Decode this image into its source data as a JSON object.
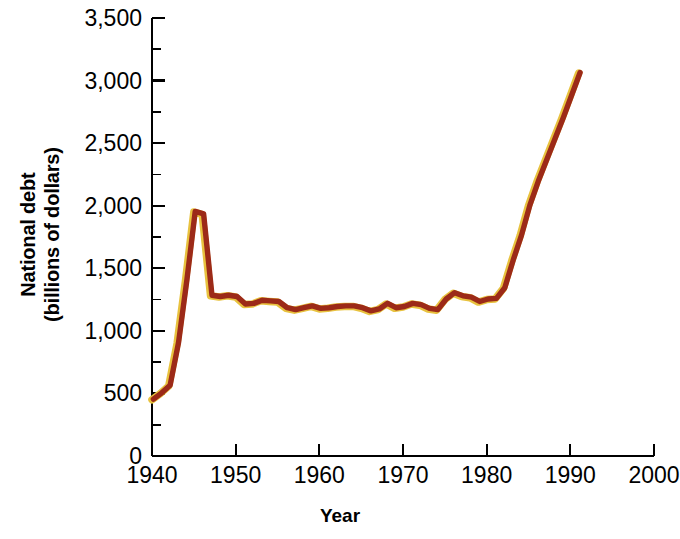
{
  "chart_data": {
    "type": "line",
    "title": "",
    "xlabel": "Year",
    "ylabel": "National debt\n(billions of dollars)",
    "ylabel_line1": "National debt",
    "ylabel_line2": "(billions of dollars)",
    "xlim": [
      1940,
      2000
    ],
    "ylim": [
      0,
      3500
    ],
    "xticks": [
      1940,
      1950,
      1960,
      1970,
      1980,
      1990,
      2000
    ],
    "xtick_labels": [
      "1940",
      "1950",
      "1960",
      "1970",
      "1980",
      "1990",
      "2000"
    ],
    "yticks": [
      0,
      500,
      1000,
      1500,
      2000,
      2500,
      3000,
      3500
    ],
    "ytick_labels": [
      "0",
      "500",
      "1,000",
      "1,500",
      "2,000",
      "2,500",
      "3,000",
      "3,500"
    ],
    "y_minor_ticks": [
      250,
      750,
      1250,
      1750,
      2250,
      2750,
      3250
    ],
    "grid": false,
    "legend": null,
    "line_color": "#9C2A18",
    "line_highlight_color": "#E8C23F",
    "axis_color": "#000000",
    "series": [
      {
        "name": "National debt",
        "x": [
          1940,
          1941,
          1942,
          1943,
          1944,
          1945,
          1946,
          1947,
          1948,
          1949,
          1950,
          1951,
          1952,
          1953,
          1954,
          1955,
          1956,
          1957,
          1958,
          1959,
          1960,
          1961,
          1962,
          1963,
          1964,
          1965,
          1966,
          1967,
          1968,
          1969,
          1970,
          1971,
          1972,
          1973,
          1974,
          1975,
          1976,
          1977,
          1978,
          1979,
          1980,
          1981,
          1982,
          1983,
          1984,
          1985,
          1986,
          1987,
          1988,
          1989,
          1990,
          1991
        ],
        "values": [
          450,
          500,
          560,
          900,
          1400,
          1950,
          1930,
          1280,
          1270,
          1280,
          1270,
          1210,
          1215,
          1240,
          1235,
          1230,
          1180,
          1165,
          1180,
          1195,
          1175,
          1180,
          1190,
          1195,
          1195,
          1180,
          1155,
          1170,
          1215,
          1180,
          1190,
          1215,
          1205,
          1175,
          1165,
          1250,
          1300,
          1275,
          1265,
          1230,
          1250,
          1255,
          1340,
          1560,
          1760,
          2000,
          2190,
          2360,
          2530,
          2700,
          2880,
          3060
        ]
      }
    ]
  }
}
